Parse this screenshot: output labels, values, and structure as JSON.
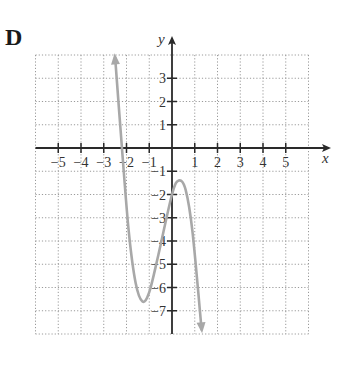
{
  "panel_label": "D",
  "colors": {
    "axis": "#2a2a2a",
    "grid": "#9a9a9a",
    "curve": "#a8a8a8",
    "text": "#333333"
  },
  "chart_data": {
    "type": "line",
    "title": "",
    "panel_label": "D",
    "xlabel": "x",
    "ylabel": "y",
    "xlim": [
      -6,
      6
    ],
    "ylim": [
      -8,
      4
    ],
    "grid": true,
    "grid_style": "dotted",
    "x_ticks": [
      -5,
      -4,
      -3,
      -2,
      -1,
      1,
      2,
      3,
      4,
      5
    ],
    "x_tick_labels": [
      "−5",
      "−4",
      "−3",
      "−2",
      "−1",
      "1",
      "2",
      "3",
      "4",
      "5"
    ],
    "y_ticks": [
      3,
      2,
      1,
      -1,
      -2,
      -3,
      -4,
      -5,
      -6,
      -7
    ],
    "y_tick_labels": [
      "3",
      "2",
      "1",
      "−1",
      "−2",
      "−3",
      "−4",
      "−5",
      "−6",
      "−7"
    ],
    "series": [
      {
        "name": "f(x)",
        "description": "cubic-like curve with arrows at both ends; rises steeply to upper-left, falls steeply to lower-right",
        "end_behavior": "arrow up at left, arrow down at right",
        "x": [
          -2.5,
          -2.2,
          -1.9,
          -1.6,
          -1.3,
          -1.0,
          -0.6,
          0.0,
          0.3,
          0.6,
          0.9,
          1.3
        ],
        "y": [
          3.9,
          0.0,
          -3.6,
          -5.8,
          -6.6,
          -6.2,
          -4.6,
          -2.0,
          -1.4,
          -1.8,
          -3.6,
          -7.8
        ]
      }
    ],
    "key_points": {
      "x_intercept": -2.2,
      "y_intercept": -2.0,
      "local_min": [
        -1.3,
        -6.6
      ],
      "local_max": [
        0.3,
        -1.4
      ]
    }
  }
}
